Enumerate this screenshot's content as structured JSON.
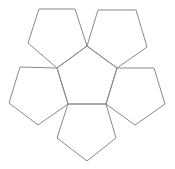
{
  "diagram": {
    "type": "pentagon-net",
    "stroke_color": "#8a8a8a",
    "background_color": "#ffffff",
    "pentagons": [
      {
        "id": "center",
        "points": "87,46 117,68 106,104 68,104 57,68"
      },
      {
        "id": "top-left",
        "points": "39,9 75,9 87,46 57,68 28,43"
      },
      {
        "id": "top-right",
        "points": "98,10 136,10 147,47 117,68 87,46"
      },
      {
        "id": "left",
        "points": "20,67 57,68 68,104 38,125 9,103"
      },
      {
        "id": "right",
        "points": "117,68 154,68 165,104 135,125 106,104"
      },
      {
        "id": "bottom",
        "points": "68,104 106,104 116,138 87,161 57,138"
      }
    ]
  }
}
